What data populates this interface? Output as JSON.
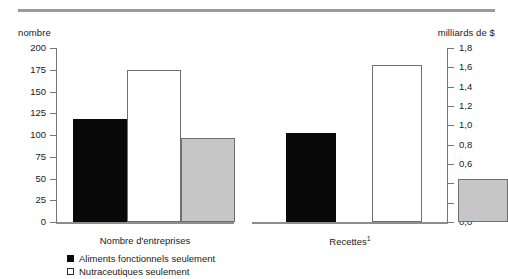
{
  "figure": {
    "left_axis_caption": "nombre",
    "right_axis_caption": "milliards de $",
    "group_label_1": "Nombre d'entreprises",
    "group_label_2": "Recettes",
    "group_label_2_footnote": "1"
  },
  "legend": {
    "items": [
      {
        "label": "Aliments fonctionnels seulement",
        "swatch": "black"
      },
      {
        "label": "Nutraceutiques seulement",
        "swatch": "white"
      }
    ]
  },
  "chart_data": {
    "type": "bar",
    "title": "",
    "xlabel": "",
    "categories": [
      "Nombre d'entreprises",
      "Recettes"
    ],
    "series": [
      {
        "name": "Aliments fonctionnels seulement",
        "color": "#080808",
        "values": [
          118,
          0.92
        ]
      },
      {
        "name": "Nutraceutiques seulement",
        "color": "#ffffff",
        "values": [
          175,
          1.62
        ]
      },
      {
        "name": "",
        "color": "#c6c6c6",
        "values": [
          97,
          0.45
        ]
      }
    ],
    "axes": [
      {
        "side": "left",
        "label": "nombre",
        "applies_to_category": "Nombre d'entreprises",
        "ylim": [
          0,
          200
        ],
        "tick_step": 25,
        "ticks": [
          200,
          175,
          150,
          125,
          100,
          75,
          50,
          25,
          0
        ],
        "tick_labels": [
          "200",
          "175",
          "150",
          "125",
          "100",
          "75",
          "50",
          "25",
          "0"
        ]
      },
      {
        "side": "right",
        "label": "milliards de $",
        "applies_to_category": "Recettes",
        "ylim": [
          0.0,
          1.8
        ],
        "tick_step": 0.2,
        "ticks": [
          1.8,
          1.6,
          1.4,
          1.2,
          1.0,
          0.8,
          0.6,
          0.4,
          0.2,
          0.0
        ],
        "tick_labels": [
          "1,8",
          "1,6",
          "1,4",
          "1,2",
          "1,0",
          "0,8",
          "0,6",
          "0,4",
          "0,2",
          "0,0"
        ]
      }
    ],
    "grid": false,
    "legend_position": "bottom-left"
  }
}
